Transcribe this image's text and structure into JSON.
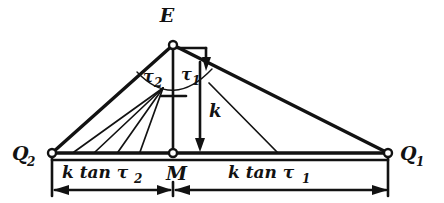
{
  "figure": {
    "background_color": "#ffffff",
    "ink_color": "#121212",
    "width": 444,
    "height": 203
  },
  "points": {
    "apex": {
      "label": "E",
      "x": 173,
      "y": 45
    },
    "left_base": {
      "label": "Q",
      "sub": "2",
      "x": 52,
      "y": 153
    },
    "mid_base": {
      "label": "M",
      "x": 173,
      "y": 153
    },
    "right_base": {
      "label": "Q",
      "sub": "1",
      "x": 388,
      "y": 153
    }
  },
  "angles": [
    {
      "name": "tau2",
      "label": "τ",
      "sub": "2",
      "side": "left"
    },
    {
      "name": "tau1",
      "label": "τ",
      "sub": "1",
      "side": "right"
    }
  ],
  "measures": {
    "height": {
      "label": "k",
      "description": "vertical distance from E down to base line at M"
    },
    "left_segment": {
      "label": "k tan τ",
      "sub": "2",
      "description": "base segment from Q2 to M"
    },
    "right_segment": {
      "label": "k tan τ",
      "sub": "1",
      "description": "base segment from M to Q1"
    }
  },
  "markers": {
    "right_angle": "right-angle-bracket-at-apex",
    "arc": "angle-arc-spanning-tau2-and-tau1"
  }
}
